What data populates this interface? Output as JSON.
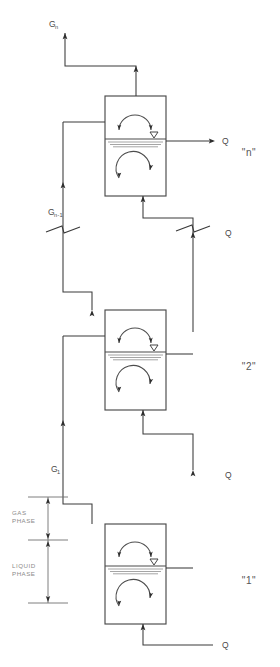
{
  "diagram": {
    "type": "process-flow-diagram",
    "stage_count": 3,
    "colors": {
      "line": "#3a3a3a",
      "vessel": "#4a4a4a",
      "hatch": "#8e8e8e",
      "label": "#4a4a4a",
      "phase_label": "#8a8a8a",
      "background": "#ffffff"
    },
    "stages": [
      {
        "id": "stage-n",
        "label": "\"n\"",
        "gas_out_label": "G",
        "gas_out_sub": "n",
        "liquid_out_label": "Q",
        "position": "top"
      },
      {
        "id": "stage-2",
        "label": "\"2\"",
        "liquid_out_label": "Q",
        "position": "middle"
      },
      {
        "id": "stage-1",
        "label": "\"1\"",
        "gas_out_label": "G",
        "gas_out_sub": "1",
        "liquid_out_label": "Q",
        "liquid_in_label": "Q",
        "position": "bottom"
      }
    ],
    "streams": [
      {
        "name": "gas-out-top",
        "label": "G",
        "sub": "n",
        "kind": "gas"
      },
      {
        "name": "gas-interstage-n-1",
        "label": "G",
        "sub": "n-1",
        "kind": "gas"
      },
      {
        "name": "gas-interstage-1",
        "label": "G",
        "sub": "1",
        "kind": "gas"
      },
      {
        "name": "liquid-out-n",
        "label": "Q",
        "sub": "",
        "kind": "liquid"
      },
      {
        "name": "liquid-out-2",
        "label": "Q",
        "sub": "",
        "kind": "liquid"
      },
      {
        "name": "liquid-out-1",
        "label": "Q",
        "sub": "",
        "kind": "liquid"
      },
      {
        "name": "liquid-in-bottom",
        "label": "Q",
        "sub": "",
        "kind": "liquid"
      }
    ],
    "phase_annotations": [
      {
        "name": "gas-phase",
        "line1": "GAS",
        "line2": "PHASE"
      },
      {
        "name": "liquid-phase",
        "line1": "LIQUID",
        "line2": "PHASE"
      }
    ],
    "break_symbols": [
      {
        "name": "break-left",
        "on_stream": "gas-interstage-n-1"
      },
      {
        "name": "break-right",
        "on_stream": "liquid-out-2"
      }
    ]
  }
}
